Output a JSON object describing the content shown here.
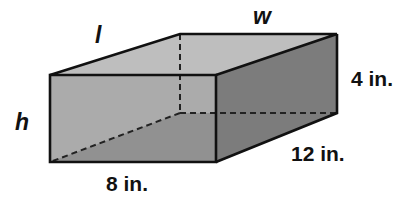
{
  "figure": {
    "type": "rectangular prism",
    "labels": {
      "length": "l",
      "width": "w",
      "height": "h",
      "front_bottom": "8 in.",
      "right_side_height": "4 in.",
      "right_bottom": "12 in."
    },
    "colors": {
      "top_face": "#bebebe",
      "front_face": "#a9a9a9",
      "floor_face": "#8f8f8f",
      "right_face": "#7c7c7c",
      "edge": "#111111"
    }
  }
}
